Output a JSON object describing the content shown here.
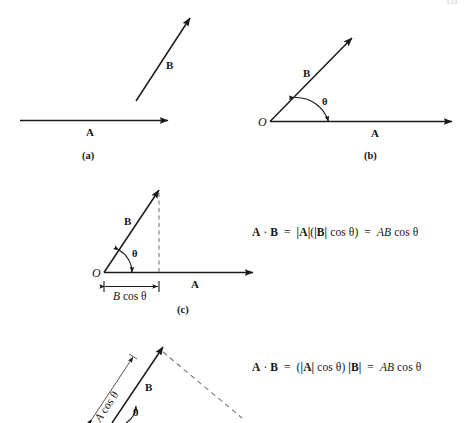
{
  "figure": {
    "kind": "vector-dot-product-geometry",
    "background_color": "#ffffff",
    "ink_color": "#1a1a1a"
  },
  "header": {
    "left_fragment": "",
    "page_number": "151"
  },
  "panels": [
    {
      "id": "a",
      "caption": "(a)",
      "vector_a_label": "A",
      "vector_b_label": "B"
    },
    {
      "id": "b",
      "caption": "(b)",
      "origin_label": "O",
      "vector_a_label": "A",
      "vector_b_label": "B",
      "angle_label": "θ"
    },
    {
      "id": "c",
      "caption": "(c)",
      "origin_label": "O",
      "vector_a_label": "A",
      "vector_b_label": "B",
      "angle_label": "θ",
      "projection_label_prefix": "B",
      "projection_label_suffix": "cos θ",
      "equation": {
        "lhs_a": "A",
        "dot": "·",
        "lhs_b": "B",
        "eq1": "=",
        "mid": "|A|(|B| cos θ)",
        "eq2": "=",
        "rhs": "AB cos θ",
        "full_text": "A · B  =  |A|(|B| cos θ)  =  AB cos θ"
      }
    },
    {
      "id": "d",
      "caption": "",
      "vector_b_label": "B",
      "angle_label": "θ",
      "projection_label_prefix": "A",
      "projection_label_suffix": "cos θ",
      "equation": {
        "full_text": "A · B  =  (|A| cos θ) |B|  =  AB cos θ"
      }
    }
  ],
  "equations": {
    "first": {
      "bold_a": "A",
      "dot_operator": "·",
      "bold_b": "B",
      "equals_one": "=",
      "term_abs_a": "|A|",
      "term_open": "(",
      "term_abs_b": "|B|",
      "term_cos": "cos θ",
      "term_close": ")",
      "equals_two": "=",
      "result_ab": "AB",
      "result_cos": "cos θ"
    },
    "second": {
      "bold_a": "A",
      "dot_operator": "·",
      "bold_b": "B",
      "equals_one": "=",
      "term_open": "(",
      "term_abs_a": "|A|",
      "term_cos": "cos θ",
      "term_close": ")",
      "term_abs_b": "|B|",
      "equals_two": "=",
      "result_ab": "AB",
      "result_cos": "cos θ"
    }
  }
}
